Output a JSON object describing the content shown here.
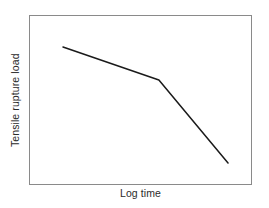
{
  "figure": {
    "background_color": "#ffffff",
    "frame_color": "#8a8a8a",
    "text_color": "#2b2b2b"
  },
  "chart_data": {
    "type": "line",
    "title": "",
    "xlabel": "Log time",
    "ylabel": "Tensile rupture load",
    "grid": false,
    "legend": false,
    "axis_ticks": false,
    "tick_labels": [],
    "annotations": [],
    "xlim": [
      0,
      100
    ],
    "ylim": [
      0,
      100
    ],
    "series": [
      {
        "name": "Stress rupture curve",
        "color": "#1a1a1a",
        "line_width": 1.5,
        "x": [
          14.8,
          57.8,
          88.8
        ],
        "y": [
          81.8,
          62.4,
          13.5
        ],
        "description": "Shallow negative slope to a knee, then a steeper decline"
      }
    ]
  }
}
